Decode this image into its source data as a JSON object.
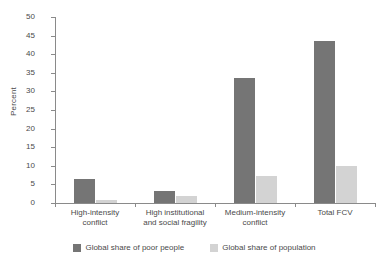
{
  "chart_data": {
    "type": "bar",
    "title": "",
    "xlabel": "",
    "ylabel": "Percent",
    "ylim": [
      0,
      50
    ],
    "yticks": [
      0,
      5,
      10,
      15,
      20,
      25,
      30,
      35,
      40,
      45,
      50
    ],
    "ytick_labels": [
      "0",
      "5",
      "10",
      "15",
      "20",
      "25",
      "30",
      "35",
      "40",
      "45",
      "50"
    ],
    "grid": false,
    "legend_position": "bottom-center",
    "categories": [
      "High-intensity conflict",
      "High institutional and social fragility",
      "Medium-intensity conflict",
      "Total FCV"
    ],
    "category_lines": [
      [
        "High-intensity",
        "conflict"
      ],
      [
        "High institutional",
        "and social fragility"
      ],
      [
        "Medium-intensity",
        "conflict"
      ],
      [
        "Total FCV",
        ""
      ]
    ],
    "series": [
      {
        "name": "Global share of poor people",
        "color": "#757575",
        "values": [
          6.4,
          3.3,
          33.6,
          43.5
        ]
      },
      {
        "name": "Global share of population",
        "color": "#d3d3d3",
        "values": [
          0.8,
          1.8,
          7.2,
          10.0
        ]
      }
    ]
  },
  "legend": {
    "items": [
      {
        "label": "Global share of poor people",
        "color": "#757575"
      },
      {
        "label": "Global share of population",
        "color": "#d3d3d3"
      }
    ]
  },
  "colors": {
    "series_dark": "#757575",
    "series_light": "#d3d3d3",
    "axis": "#8a8a8a",
    "text": "#4a4a4a",
    "background": "#ffffff"
  }
}
